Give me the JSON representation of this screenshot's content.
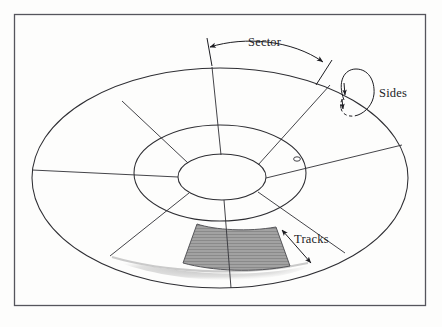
{
  "figure": {
    "background_color": "#fdfdfc",
    "frame_color": "#55555c",
    "line_color": "#2e2e33",
    "shaded_sector_color": "#8e8e8e",
    "shadow_color": "#b9b9b9"
  },
  "labels": {
    "sector": "Sector",
    "sides": "Sides",
    "tracks": "Tracks"
  },
  "annotations": [
    {
      "name": "sector-arc-arrow",
      "label": "Sector",
      "kind": "double-headed-arc",
      "describes": "angular span of one sector along the outer rim"
    },
    {
      "name": "sides-loop-arrow",
      "label": "Sides",
      "kind": "looping-arrow",
      "describes": "the two surfaces of the platter, wrapping over the rim"
    },
    {
      "name": "tracks-arrow",
      "label": "Tracks",
      "kind": "double-headed-straight",
      "describes": "radial width spanned by tracks in a ring"
    }
  ],
  "geometry": {
    "platter_rings": 3,
    "radial_divider_count": 8,
    "outer_ellipse": {
      "cx": 220,
      "cy": 178,
      "rx": 188,
      "ry": 110
    },
    "middle_ellipse": {
      "cx": 220,
      "cy": 173,
      "rx": 86,
      "ry": 48
    },
    "inner_ellipse": {
      "cx": 222,
      "cy": 177,
      "rx": 44,
      "ry": 23
    },
    "shaded_sector": {
      "ring": "outer",
      "position": "bottom"
    },
    "hub_marker": {
      "cx": 297,
      "cy": 158,
      "r": 2.6
    }
  }
}
